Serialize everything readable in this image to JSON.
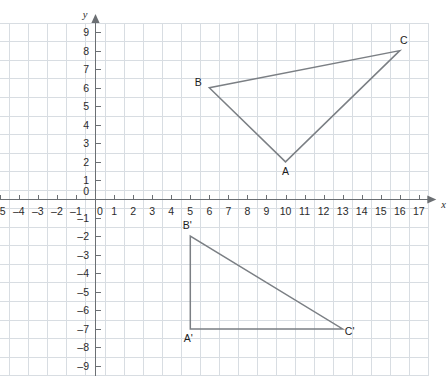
{
  "chart_data": {
    "type": "scatter",
    "title": "",
    "xlabel": "x",
    "ylabel": "y",
    "xlim": [
      -5.5,
      17.6
    ],
    "ylim": [
      -9.5,
      9.6
    ],
    "grid": true,
    "grid_step": 1,
    "legend": "none",
    "x_ticks": [
      -5,
      -4,
      -3,
      -2,
      -1,
      0,
      1,
      2,
      3,
      4,
      5,
      6,
      7,
      8,
      9,
      10,
      11,
      12,
      13,
      14,
      15,
      16,
      17
    ],
    "y_ticks": [
      9,
      8,
      7,
      6,
      5,
      4,
      3,
      2,
      1,
      0,
      -1,
      -2,
      -3,
      -4,
      -5,
      -6,
      -7,
      -8,
      -9
    ],
    "series": [
      {
        "name": "Triangle ABC",
        "closed": true,
        "points": [
          {
            "label": "A",
            "x": 10,
            "y": 2,
            "label_dx": 0,
            "label_dy": 13
          },
          {
            "label": "B",
            "x": 6,
            "y": 6,
            "label_dx": -11,
            "label_dy": -2
          },
          {
            "label": "C",
            "x": 16,
            "y": 8,
            "label_dx": 4,
            "label_dy": -7
          }
        ]
      },
      {
        "name": "Triangle A'B'C'",
        "closed": true,
        "points": [
          {
            "label": "A'",
            "x": 5,
            "y": -7,
            "label_dx": -2,
            "label_dy": 13
          },
          {
            "label": "B'",
            "x": 5,
            "y": -2,
            "label_dx": -3,
            "label_dy": -7
          },
          {
            "label": "C'",
            "x": 13,
            "y": -7,
            "label_dx": 7,
            "label_dy": 6
          }
        ]
      }
    ]
  },
  "axes": {
    "x_axis_name": "x",
    "y_axis_name": "y",
    "origin_label": "0"
  },
  "colors": {
    "grid": "#d8dde2",
    "axis": "#6b6f73",
    "shape_stroke": "#7b7f84",
    "text": "#2b2b2b",
    "background": "#ffffff"
  }
}
